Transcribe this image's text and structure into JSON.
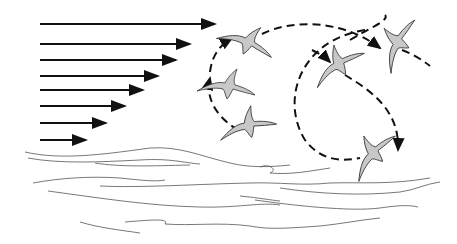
{
  "diagram": {
    "colors": {
      "background": "#ffffff",
      "arrow": "#111111",
      "path": "#111111",
      "bird_fill": "#c8c8c8",
      "bird_stroke": "#333333",
      "wave": "#555555"
    },
    "wind_gradient_arrows": [
      {
        "x1": 40,
        "x2": 215,
        "y": 24
      },
      {
        "x1": 40,
        "x2": 190,
        "y": 44
      },
      {
        "x1": 40,
        "x2": 176,
        "y": 60
      },
      {
        "x1": 40,
        "x2": 158,
        "y": 76
      },
      {
        "x1": 40,
        "x2": 143,
        "y": 90
      },
      {
        "x1": 40,
        "x2": 125,
        "y": 106
      },
      {
        "x1": 40,
        "x2": 106,
        "y": 123
      },
      {
        "x1": 40,
        "x2": 86,
        "y": 140
      }
    ],
    "birds": [
      {
        "name": "bird-top-left",
        "x": 245,
        "y": 40,
        "rot": 15
      },
      {
        "name": "bird-middle-left",
        "x": 225,
        "y": 85,
        "rot": 0
      },
      {
        "name": "bird-lower-left",
        "x": 245,
        "y": 125,
        "rot": -20
      },
      {
        "name": "bird-center",
        "x": 335,
        "y": 65,
        "rot": -40
      },
      {
        "name": "bird-top-right",
        "x": 395,
        "y": 45,
        "rot": -70
      },
      {
        "name": "bird-bottom-right",
        "x": 370,
        "y": 155,
        "rot": -55
      }
    ]
  }
}
